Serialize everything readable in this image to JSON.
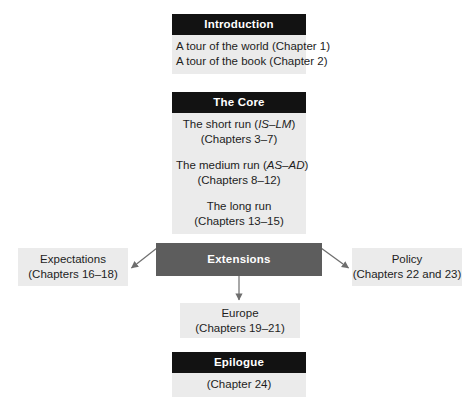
{
  "diagram": {
    "colors": {
      "header_black": "#121212",
      "header_gray": "#5d5d5d",
      "box_fill": "#ebebeb",
      "text": "#1d1d1d",
      "arrow": "#6e6e6e"
    },
    "nodes": {
      "introduction": {
        "header": "Introduction",
        "lines": [
          "A tour of the world (Chapter 1)",
          "A tour of the book (Chapter 2)"
        ]
      },
      "core": {
        "header": "The Core",
        "groups": [
          {
            "title_prefix": "The short run (",
            "title_italic": "IS–LM",
            "title_suffix": ")",
            "chapters": "(Chapters 3–7)"
          },
          {
            "title_prefix": "The medium run (",
            "title_italic": "AS–AD",
            "title_suffix": ")",
            "chapters": "(Chapters 8–12)"
          },
          {
            "title_prefix": "The long run",
            "title_italic": "",
            "title_suffix": "",
            "chapters": "(Chapters 13–15)"
          }
        ]
      },
      "extensions": {
        "header": "Extensions"
      },
      "expectations": {
        "line1": "Expectations",
        "line2": "(Chapters 16–18)"
      },
      "europe": {
        "line1": "Europe",
        "line2": "(Chapters 19–21)"
      },
      "policy": {
        "line1": "Policy",
        "line2": "(Chapters 22 and 23)"
      },
      "epilogue": {
        "header": "Epilogue",
        "lines": [
          "(Chapter 24)"
        ]
      }
    },
    "edges": [
      {
        "name": "extensions-to-expectations",
        "from": "extensions",
        "to": "expectations"
      },
      {
        "name": "extensions-to-europe",
        "from": "extensions",
        "to": "europe"
      },
      {
        "name": "extensions-to-policy",
        "from": "extensions",
        "to": "policy"
      }
    ]
  }
}
